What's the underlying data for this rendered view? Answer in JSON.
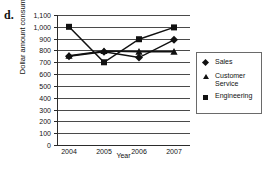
{
  "panel": {
    "letter": "d."
  },
  "chart_data": {
    "type": "line",
    "title": "",
    "xlabel": "Year",
    "ylabel": "Dollar amount consumed",
    "categories": [
      "2004",
      "2005",
      "2006",
      "2007"
    ],
    "x": [
      2004,
      2005,
      2006,
      2007
    ],
    "ylim": [
      0,
      1100
    ],
    "ytick_values": [
      0,
      100,
      200,
      300,
      400,
      500,
      600,
      700,
      800,
      900,
      1000,
      1100
    ],
    "ytick_labels": [
      "0",
      "100",
      "200",
      "300",
      "400",
      "500",
      "600",
      "700",
      "800",
      "900",
      "1,000",
      "1,100"
    ],
    "grid": true,
    "grid_axis": "y",
    "legend_position": "right",
    "series": [
      {
        "name": "Sales",
        "marker": "diamond",
        "values": [
          750,
          790,
          740,
          890
        ]
      },
      {
        "name": "Customer Service",
        "marker": "triangle",
        "values": [
          755,
          795,
          790,
          790
        ]
      },
      {
        "name": "Engineering",
        "marker": "square",
        "values": [
          1000,
          700,
          895,
          995
        ]
      }
    ]
  },
  "legend": {
    "items": [
      {
        "label": "Sales",
        "marker": "diamond-marker-icon"
      },
      {
        "label": "Customer Service",
        "marker": "triangle-marker-icon"
      },
      {
        "label": "Engineering",
        "marker": "square-marker-icon"
      }
    ]
  },
  "colors": {
    "series": "#111111",
    "grid": "#4a4a4a",
    "axis": "#2b2b2b",
    "background": "#ffffff"
  }
}
